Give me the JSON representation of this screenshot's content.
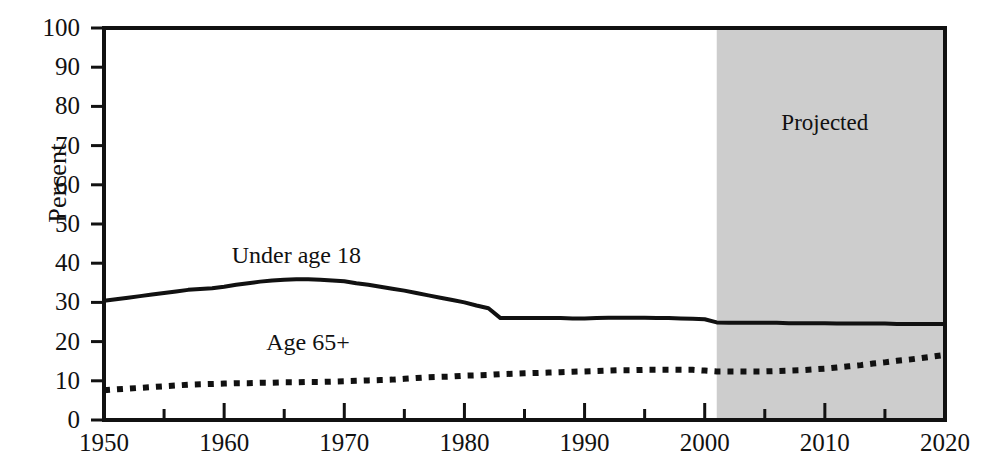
{
  "chart_data": {
    "type": "line",
    "title": "",
    "subtitle": "",
    "xlabel": "",
    "ylabel": "Percent",
    "xlim": [
      1950,
      2020
    ],
    "ylim": [
      0,
      100
    ],
    "grid": false,
    "legend_position": "inline-annotations",
    "x_tick_labels": [
      "1950",
      "1960",
      "1970",
      "1980",
      "1990",
      "2000",
      "2010",
      "2020"
    ],
    "x_major_ticks": [
      1950,
      1960,
      1970,
      1980,
      1990,
      2000,
      2010,
      2020
    ],
    "x_minor_ticks": [
      1955,
      1965,
      1975,
      1985,
      1995,
      2005,
      2015
    ],
    "y_tick_labels": [
      "0",
      "10",
      "20",
      "30",
      "40",
      "50",
      "60",
      "70",
      "80",
      "90",
      "100"
    ],
    "y_major_ticks": [
      0,
      10,
      20,
      30,
      40,
      50,
      60,
      70,
      80,
      90,
      100
    ],
    "annotations": [
      {
        "name": "projected-region-label",
        "text": "Projected",
        "x": 2010,
        "y": 76
      },
      {
        "name": "under-18-series-label",
        "text": "Under age 18",
        "x": 1966,
        "y": 42
      },
      {
        "name": "age-65-series-label",
        "text": "Age 65+",
        "x": 1967,
        "y": 20
      }
    ],
    "shaded_regions": [
      {
        "name": "projected",
        "label": "Projected",
        "x_start": 2001,
        "x_end": 2020,
        "color": "#cdcdcd"
      }
    ],
    "series": [
      {
        "name": "Under age 18",
        "style": "solid",
        "color": "#111111",
        "x": [
          1950,
          1951,
          1952,
          1953,
          1954,
          1955,
          1956,
          1957,
          1958,
          1959,
          1960,
          1961,
          1962,
          1963,
          1964,
          1965,
          1966,
          1967,
          1968,
          1969,
          1970,
          1971,
          1972,
          1973,
          1974,
          1975,
          1976,
          1977,
          1978,
          1979,
          1980,
          1981,
          1982,
          1983,
          1984,
          1985,
          1986,
          1987,
          1988,
          1989,
          1990,
          1991,
          1992,
          1993,
          1994,
          1995,
          1996,
          1997,
          1998,
          1999,
          2000,
          2001,
          2002,
          2003,
          2004,
          2005,
          2006,
          2007,
          2008,
          2009,
          2010,
          2011,
          2012,
          2013,
          2014,
          2015,
          2016,
          2017,
          2018,
          2019,
          2020
        ],
        "y": [
          30.4,
          30.8,
          31.2,
          31.6,
          32.0,
          32.4,
          32.8,
          33.2,
          33.4,
          33.6,
          34.0,
          34.5,
          34.9,
          35.3,
          35.6,
          35.8,
          35.9,
          35.9,
          35.8,
          35.6,
          35.4,
          34.9,
          34.5,
          34.0,
          33.5,
          33.0,
          32.4,
          31.8,
          31.2,
          30.6,
          30.0,
          29.2,
          28.5,
          26.0,
          26.0,
          26.0,
          26.0,
          26.0,
          26.0,
          25.9,
          25.9,
          26.0,
          26.1,
          26.1,
          26.1,
          26.1,
          26.0,
          26.0,
          25.9,
          25.8,
          25.7,
          24.9,
          24.8,
          24.8,
          24.8,
          24.8,
          24.8,
          24.7,
          24.7,
          24.7,
          24.7,
          24.6,
          24.6,
          24.6,
          24.6,
          24.6,
          24.5,
          24.5,
          24.5,
          24.5,
          24.5
        ]
      },
      {
        "name": "Age 65+",
        "style": "dotted",
        "color": "#111111",
        "x": [
          1950,
          1951,
          1952,
          1953,
          1954,
          1955,
          1956,
          1957,
          1958,
          1959,
          1960,
          1961,
          1962,
          1963,
          1964,
          1965,
          1966,
          1967,
          1968,
          1969,
          1970,
          1971,
          1972,
          1973,
          1974,
          1975,
          1976,
          1977,
          1978,
          1979,
          1980,
          1981,
          1982,
          1983,
          1984,
          1985,
          1986,
          1987,
          1988,
          1989,
          1990,
          1991,
          1992,
          1993,
          1994,
          1995,
          1996,
          1997,
          1998,
          1999,
          2000,
          2001,
          2002,
          2003,
          2004,
          2005,
          2006,
          2007,
          2008,
          2009,
          2010,
          2011,
          2012,
          2013,
          2014,
          2015,
          2016,
          2017,
          2018,
          2019,
          2020
        ],
        "y": [
          7.6,
          7.8,
          8.0,
          8.2,
          8.4,
          8.6,
          8.8,
          9.0,
          9.1,
          9.2,
          9.3,
          9.4,
          9.4,
          9.5,
          9.5,
          9.6,
          9.6,
          9.7,
          9.7,
          9.8,
          9.9,
          10.0,
          10.1,
          10.2,
          10.3,
          10.5,
          10.7,
          10.9,
          11.0,
          11.1,
          11.3,
          11.4,
          11.5,
          11.7,
          11.8,
          11.9,
          12.0,
          12.1,
          12.2,
          12.3,
          12.4,
          12.5,
          12.6,
          12.7,
          12.7,
          12.8,
          12.8,
          12.8,
          12.8,
          12.8,
          12.6,
          12.4,
          12.4,
          12.4,
          12.4,
          12.4,
          12.5,
          12.6,
          12.7,
          12.9,
          13.1,
          13.4,
          13.7,
          14.0,
          14.4,
          14.7,
          15.1,
          15.4,
          15.8,
          16.2,
          16.6
        ]
      }
    ]
  }
}
